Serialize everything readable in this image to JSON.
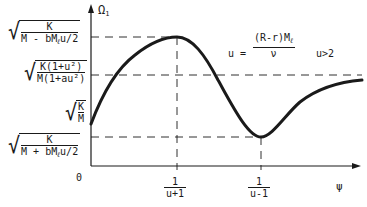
{
  "diagram": {
    "y_axis": {
      "label": "Ω",
      "label_sub": "1"
    },
    "x_axis": {
      "label": "ψ",
      "origin": "0"
    },
    "y_levels": [
      {
        "id": "max",
        "num": "K",
        "den_a": "M - bM",
        "den_sub": "ℓ",
        "den_b": "u/2"
      },
      {
        "id": "asymptote",
        "num": "K(1+u²)",
        "den": "M(1+au²)"
      },
      {
        "id": "start",
        "num": "K",
        "den": "M"
      },
      {
        "id": "min",
        "num": "K",
        "den_a": "M + bM",
        "den_sub": "ℓ",
        "den_b": "u/2"
      }
    ],
    "x_ticks": [
      {
        "num": "1",
        "den": "u+1"
      },
      {
        "num": "1",
        "den": "u-1"
      }
    ],
    "definition": {
      "lhs": "u =",
      "num_a": "(R-r)M",
      "num_sub": "ℓ",
      "den": "ν",
      "condition": "u>2"
    },
    "colors": {
      "ink": "#1a1a1a",
      "background": "#ffffff"
    }
  }
}
